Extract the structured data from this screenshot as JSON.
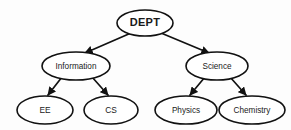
{
  "diagram": {
    "type": "tree-hierarchy",
    "background_color": "#fdfdfd",
    "node_fill_color": "#ffffff",
    "node_stroke_color": "#111111",
    "edge_color": "#111111",
    "text_color": "#1a1a1a",
    "nodes": [
      {
        "id": "dept",
        "label": "DEPT",
        "level": 0,
        "shape": "ellipse",
        "cx": 145,
        "cy": 23,
        "rx": 28,
        "ry": 13
      },
      {
        "id": "information",
        "label": "Information",
        "level": 1,
        "shape": "ellipse",
        "cx": 76,
        "cy": 66,
        "rx": 34,
        "ry": 14
      },
      {
        "id": "science",
        "label": "Science",
        "level": 1,
        "shape": "ellipse",
        "cx": 217,
        "cy": 66,
        "rx": 31,
        "ry": 14
      },
      {
        "id": "ee",
        "label": "EE",
        "level": 2,
        "shape": "ellipse",
        "cx": 45,
        "cy": 110,
        "rx": 28,
        "ry": 14
      },
      {
        "id": "cs",
        "label": "CS",
        "level": 2,
        "shape": "ellipse",
        "cx": 111,
        "cy": 110,
        "rx": 27,
        "ry": 14
      },
      {
        "id": "physics",
        "label": "Physics",
        "level": 2,
        "shape": "ellipse",
        "cx": 186,
        "cy": 110,
        "rx": 31,
        "ry": 14
      },
      {
        "id": "chemistry",
        "label": "Chemistry",
        "level": 2,
        "shape": "ellipse",
        "cx": 252,
        "cy": 110,
        "rx": 33,
        "ry": 14
      }
    ],
    "edges": [
      {
        "id": "dept-information",
        "from": "dept",
        "to": "information",
        "arrowhead": true,
        "x1": 131,
        "y1": 33,
        "x2": 85,
        "y2": 53
      },
      {
        "id": "dept-science",
        "from": "dept",
        "to": "science",
        "arrowhead": true,
        "x1": 161,
        "y1": 33,
        "x2": 209,
        "y2": 53
      },
      {
        "id": "information-ee",
        "from": "information",
        "to": "ee",
        "arrowhead": true,
        "x1": 62,
        "y1": 77,
        "x2": 48,
        "y2": 96
      },
      {
        "id": "information-cs",
        "from": "information",
        "to": "cs",
        "arrowhead": true,
        "x1": 92,
        "y1": 77,
        "x2": 108,
        "y2": 96
      },
      {
        "id": "science-physics",
        "from": "science",
        "to": "physics",
        "arrowhead": true,
        "x1": 205,
        "y1": 77,
        "x2": 190,
        "y2": 96
      },
      {
        "id": "science-chemistry",
        "from": "science",
        "to": "chemistry",
        "arrowhead": true,
        "x1": 230,
        "y1": 77,
        "x2": 246,
        "y2": 96
      }
    ]
  }
}
